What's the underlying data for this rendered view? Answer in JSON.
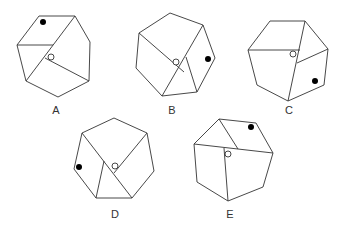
{
  "figure": {
    "options": [
      {
        "label": "A",
        "black_dot_region": "top-left",
        "white_dot": "center"
      },
      {
        "label": "B",
        "black_dot_region": "right",
        "white_dot": "center"
      },
      {
        "label": "C",
        "black_dot_region": "bottom-right",
        "white_dot": "center"
      },
      {
        "label": "D",
        "black_dot_region": "left",
        "white_dot": "center"
      },
      {
        "label": "E",
        "black_dot_region": "top-right",
        "white_dot": "center"
      }
    ],
    "colors": {
      "line": "#333333",
      "black_dot": "#000000",
      "white_dot": "#ffffff"
    }
  }
}
